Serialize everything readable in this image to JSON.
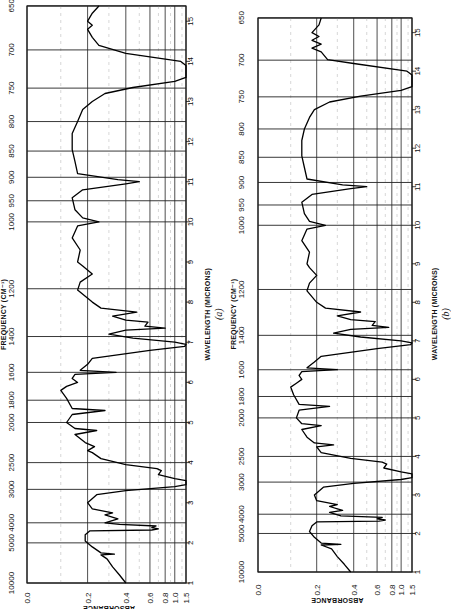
{
  "figure": {
    "panels": [
      "(a)",
      "(b)"
    ]
  },
  "chart_data": [
    {
      "type": "line",
      "panel_label": "(a)",
      "title": "",
      "orientation": "rotated 90° counter-clockwise (wavelength runs bottom-to-top, absorbance left-to-right)",
      "xlabel": "WAVELENGTH (MICRONS)",
      "x2label": "FREQUENCY (CM⁻¹)",
      "ylabel": "ABSORBANCE",
      "wavelength_ticks": [
        1,
        2,
        3,
        4,
        5,
        6,
        7,
        8,
        9,
        10,
        11,
        12,
        13,
        14,
        15
      ],
      "frequency_ticks": [
        10000,
        5000,
        4000,
        3000,
        2500,
        2000,
        1800,
        1600,
        1400,
        1200,
        1000,
        950,
        900,
        850,
        800,
        750,
        700,
        650
      ],
      "absorbance_ticks": [
        "0.0",
        "0.2",
        "0.4",
        "0.6",
        "0.8",
        "1.0",
        "1.5"
      ],
      "xlim_microns": [
        1,
        15.38
      ],
      "ylim_absorbance": [
        0.0,
        1.5
      ],
      "grid": true,
      "series": [
        {
          "name": "spectrum-a",
          "points_wavelength_absorbance": [
            [
              1.0,
              0.4
            ],
            [
              1.2,
              0.36
            ],
            [
              1.4,
              0.32
            ],
            [
              1.6,
              0.29
            ],
            [
              1.7,
              0.26
            ],
            [
              1.72,
              0.33
            ],
            [
              1.75,
              0.26
            ],
            [
              1.9,
              0.22
            ],
            [
              2.05,
              0.19
            ],
            [
              2.2,
              0.19
            ],
            [
              2.3,
              0.21
            ],
            [
              2.32,
              0.62
            ],
            [
              2.35,
              0.7
            ],
            [
              2.38,
              0.62
            ],
            [
              2.42,
              0.67
            ],
            [
              2.46,
              0.36
            ],
            [
              2.5,
              0.28
            ],
            [
              2.6,
              0.35
            ],
            [
              2.7,
              0.28
            ],
            [
              2.75,
              0.32
            ],
            [
              2.85,
              0.22
            ],
            [
              3.0,
              0.2
            ],
            [
              3.2,
              0.24
            ],
            [
              3.3,
              0.4
            ],
            [
              3.4,
              1.0
            ],
            [
              3.45,
              1.5
            ],
            [
              3.5,
              1.5
            ],
            [
              3.55,
              1.5
            ],
            [
              3.6,
              1.0
            ],
            [
              3.7,
              0.7
            ],
            [
              3.8,
              0.74
            ],
            [
              3.85,
              0.68
            ],
            [
              3.95,
              0.4
            ],
            [
              4.1,
              0.26
            ],
            [
              4.25,
              0.22
            ],
            [
              4.3,
              0.2
            ],
            [
              4.4,
              0.23
            ],
            [
              4.5,
              0.19
            ],
            [
              4.7,
              0.15
            ],
            [
              4.8,
              0.24
            ],
            [
              4.85,
              0.15
            ],
            [
              5.0,
              0.12
            ],
            [
              5.2,
              0.14
            ],
            [
              5.3,
              0.28
            ],
            [
              5.35,
              0.14
            ],
            [
              5.6,
              0.12
            ],
            [
              5.8,
              0.1
            ],
            [
              5.9,
              0.12
            ],
            [
              6.0,
              0.16
            ],
            [
              6.1,
              0.14
            ],
            [
              6.2,
              0.15
            ],
            [
              6.25,
              0.34
            ],
            [
              6.3,
              0.17
            ],
            [
              6.45,
              0.2
            ],
            [
              6.6,
              0.22
            ],
            [
              6.8,
              0.6
            ],
            [
              6.9,
              1.4
            ],
            [
              6.95,
              1.5
            ],
            [
              7.0,
              1.0
            ],
            [
              7.1,
              0.45
            ],
            [
              7.2,
              0.3
            ],
            [
              7.3,
              0.4
            ],
            [
              7.35,
              0.8
            ],
            [
              7.4,
              0.55
            ],
            [
              7.5,
              0.58
            ],
            [
              7.55,
              0.4
            ],
            [
              7.65,
              0.32
            ],
            [
              7.75,
              0.48
            ],
            [
              7.85,
              0.26
            ],
            [
              8.0,
              0.22
            ],
            [
              8.3,
              0.16
            ],
            [
              8.5,
              0.17
            ],
            [
              8.7,
              0.22
            ],
            [
              8.9,
              0.18
            ],
            [
              9.0,
              0.16
            ],
            [
              9.3,
              0.17
            ],
            [
              9.6,
              0.14
            ],
            [
              9.9,
              0.16
            ],
            [
              10.0,
              0.25
            ],
            [
              10.1,
              0.18
            ],
            [
              10.3,
              0.15
            ],
            [
              10.6,
              0.14
            ],
            [
              10.8,
              0.18
            ],
            [
              10.95,
              0.4
            ],
            [
              11.0,
              0.5
            ],
            [
              11.05,
              0.35
            ],
            [
              11.2,
              0.16
            ],
            [
              11.5,
              0.15
            ],
            [
              11.8,
              0.14
            ],
            [
              12.2,
              0.14
            ],
            [
              12.5,
              0.16
            ],
            [
              12.8,
              0.18
            ],
            [
              13.0,
              0.22
            ],
            [
              13.2,
              0.28
            ],
            [
              13.35,
              0.45
            ],
            [
              13.5,
              1.0
            ],
            [
              13.6,
              1.5
            ],
            [
              13.9,
              1.5
            ],
            [
              14.0,
              1.2
            ],
            [
              14.2,
              0.4
            ],
            [
              14.4,
              0.25
            ],
            [
              14.6,
              0.22
            ],
            [
              14.8,
              0.2
            ],
            [
              14.9,
              0.22
            ],
            [
              15.0,
              0.2
            ],
            [
              15.2,
              0.22
            ],
            [
              15.38,
              0.25
            ]
          ]
        }
      ]
    },
    {
      "type": "line",
      "panel_label": "(b)",
      "title": "",
      "orientation": "rotated 90° counter-clockwise (wavelength runs bottom-to-top, absorbance left-to-right)",
      "xlabel": "WAVELENGTH (MICRONS)",
      "x2label": "FREQUENCY (CM⁻¹)",
      "ylabel": "ABSORBANCE",
      "wavelength_ticks": [
        1,
        2,
        3,
        4,
        5,
        6,
        7,
        8,
        9,
        10,
        11,
        12,
        13,
        14,
        15
      ],
      "frequency_ticks": [
        10000,
        5000,
        4000,
        3000,
        2500,
        2000,
        1800,
        1600,
        1400,
        1200,
        1000,
        950,
        900,
        850,
        800,
        750,
        700,
        650
      ],
      "absorbance_ticks": [
        "0.0",
        "0.2",
        "0.4",
        "0.6",
        "0.8",
        "1.0",
        "1.5"
      ],
      "xlim_microns": [
        1,
        15.38
      ],
      "ylim_absorbance": [
        0.0,
        1.5
      ],
      "grid": true,
      "series": [
        {
          "name": "spectrum-b",
          "points_wavelength_absorbance": [
            [
              1.0,
              0.38
            ],
            [
              1.2,
              0.34
            ],
            [
              1.4,
              0.3
            ],
            [
              1.6,
              0.27
            ],
            [
              1.7,
              0.22
            ],
            [
              1.72,
              0.32
            ],
            [
              1.75,
              0.22
            ],
            [
              1.9,
              0.19
            ],
            [
              2.05,
              0.17
            ],
            [
              2.2,
              0.18
            ],
            [
              2.3,
              0.2
            ],
            [
              2.32,
              0.62
            ],
            [
              2.35,
              0.7
            ],
            [
              2.38,
              0.6
            ],
            [
              2.42,
              0.66
            ],
            [
              2.46,
              0.32
            ],
            [
              2.55,
              0.26
            ],
            [
              2.6,
              0.33
            ],
            [
              2.7,
              0.26
            ],
            [
              2.75,
              0.3
            ],
            [
              2.85,
              0.2
            ],
            [
              3.0,
              0.19
            ],
            [
              3.2,
              0.23
            ],
            [
              3.3,
              0.4
            ],
            [
              3.4,
              1.0
            ],
            [
              3.45,
              1.5
            ],
            [
              3.5,
              1.5
            ],
            [
              3.55,
              1.5
            ],
            [
              3.6,
              1.0
            ],
            [
              3.7,
              0.68
            ],
            [
              3.8,
              0.72
            ],
            [
              3.85,
              0.66
            ],
            [
              3.95,
              0.38
            ],
            [
              4.1,
              0.22
            ],
            [
              4.25,
              0.2
            ],
            [
              4.3,
              0.28
            ],
            [
              4.35,
              0.19
            ],
            [
              4.5,
              0.16
            ],
            [
              4.7,
              0.14
            ],
            [
              4.8,
              0.22
            ],
            [
              4.85,
              0.14
            ],
            [
              5.0,
              0.12
            ],
            [
              5.2,
              0.13
            ],
            [
              5.3,
              0.26
            ],
            [
              5.35,
              0.13
            ],
            [
              5.6,
              0.11
            ],
            [
              5.8,
              0.1
            ],
            [
              5.9,
              0.12
            ],
            [
              6.0,
              0.14
            ],
            [
              6.1,
              0.13
            ],
            [
              6.2,
              0.14
            ],
            [
              6.25,
              0.3
            ],
            [
              6.3,
              0.16
            ],
            [
              6.45,
              0.19
            ],
            [
              6.6,
              0.22
            ],
            [
              6.8,
              0.6
            ],
            [
              6.9,
              1.4
            ],
            [
              6.95,
              1.5
            ],
            [
              7.0,
              1.0
            ],
            [
              7.1,
              0.45
            ],
            [
              7.2,
              0.28
            ],
            [
              7.3,
              0.38
            ],
            [
              7.35,
              0.75
            ],
            [
              7.4,
              0.55
            ],
            [
              7.5,
              0.58
            ],
            [
              7.55,
              0.38
            ],
            [
              7.65,
              0.3
            ],
            [
              7.75,
              0.45
            ],
            [
              7.85,
              0.24
            ],
            [
              8.0,
              0.2
            ],
            [
              8.3,
              0.16
            ],
            [
              8.5,
              0.17
            ],
            [
              8.7,
              0.2
            ],
            [
              8.9,
              0.17
            ],
            [
              9.0,
              0.16
            ],
            [
              9.3,
              0.17
            ],
            [
              9.6,
              0.14
            ],
            [
              9.9,
              0.16
            ],
            [
              10.0,
              0.24
            ],
            [
              10.1,
              0.17
            ],
            [
              10.3,
              0.15
            ],
            [
              10.6,
              0.14
            ],
            [
              10.8,
              0.18
            ],
            [
              10.95,
              0.38
            ],
            [
              11.0,
              0.5
            ],
            [
              11.05,
              0.33
            ],
            [
              11.2,
              0.16
            ],
            [
              11.5,
              0.15
            ],
            [
              11.8,
              0.14
            ],
            [
              12.2,
              0.14
            ],
            [
              12.5,
              0.15
            ],
            [
              12.8,
              0.17
            ],
            [
              13.0,
              0.19
            ],
            [
              13.2,
              0.26
            ],
            [
              13.35,
              0.45
            ],
            [
              13.5,
              1.0
            ],
            [
              13.6,
              1.5
            ],
            [
              13.9,
              1.5
            ],
            [
              14.0,
              1.2
            ],
            [
              14.2,
              0.4
            ],
            [
              14.3,
              0.25
            ],
            [
              14.5,
              0.22
            ],
            [
              14.6,
              0.18
            ],
            [
              14.7,
              0.22
            ],
            [
              14.8,
              0.18
            ],
            [
              14.9,
              0.21
            ],
            [
              15.0,
              0.18
            ],
            [
              15.2,
              0.21
            ],
            [
              15.38,
              0.22
            ]
          ]
        }
      ]
    }
  ]
}
